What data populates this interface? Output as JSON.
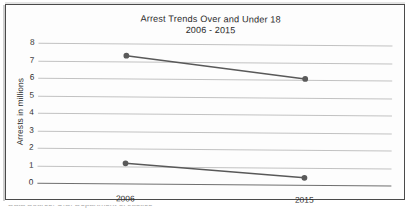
{
  "chart_data": {
    "type": "line",
    "title": "Arrest Trends Over and Under 18",
    "subtitle": "2006 - 2015",
    "xlabel": "",
    "ylabel": "Arrests in millions",
    "categories": [
      "2006",
      "2015"
    ],
    "ylim": [
      0,
      8
    ],
    "yticks": [
      "0",
      "1",
      "2",
      "3",
      "4",
      "5",
      "6",
      "7",
      "8"
    ],
    "grid": true,
    "legend": "none",
    "series": [
      {
        "name": "Over 18",
        "values": [
          7.3,
          6.05
        ]
      },
      {
        "name": "Under 18",
        "values": [
          1.15,
          0.4
        ]
      }
    ],
    "line_color": "#595959",
    "marker_color": "#5a5a5a",
    "gridline_color": "#c2c2c2",
    "baseline_color": "#6f6f6f"
  },
  "page": {
    "bottom_caption_fragment": "Data Source: U.S. Department of Justice"
  }
}
